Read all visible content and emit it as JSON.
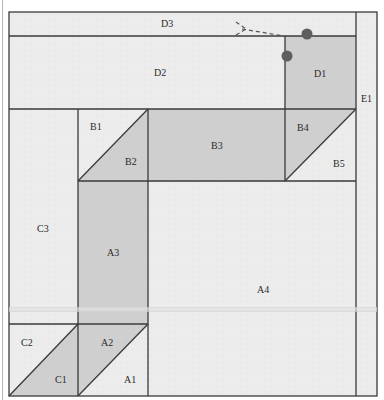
{
  "diagram": {
    "type": "quilt-block-layout",
    "colors": {
      "light_fabric": "#ececec",
      "dark_fabric": "#cfcfcf",
      "seam_line": "#3a3a3a",
      "marker_dot": "#5e5e5e",
      "dashed_arrow": "#555555"
    },
    "pieces": {
      "D3": "D3",
      "D2": "D2",
      "D1": "D1",
      "E1": "E1",
      "B1": "B1",
      "B2": "B2",
      "B3": "B3",
      "B4": "B4",
      "B5": "B5",
      "C3": "C3",
      "A3": "A3",
      "A4": "A4",
      "C2": "C2",
      "C1": "C1",
      "A2": "A2",
      "A1": "A1"
    },
    "markers": [
      {
        "name": "dot-top",
        "x": 307,
        "y": 34
      },
      {
        "name": "dot-left",
        "x": 287,
        "y": 56
      }
    ]
  }
}
